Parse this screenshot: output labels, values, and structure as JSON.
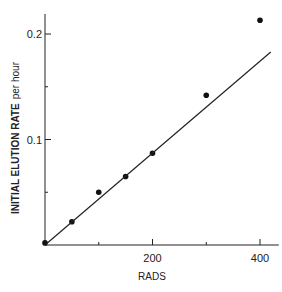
{
  "chart_data": {
    "type": "scatter",
    "title": "",
    "xlabel": "RADS",
    "ylabel": "INITIAL ELUTION RATE",
    "ylabel_unit": "per hour",
    "xlim": [
      0,
      420
    ],
    "ylim": [
      0,
      0.22
    ],
    "x_ticks": [
      0,
      100,
      200,
      300,
      400
    ],
    "x_tick_labels": [
      "",
      "",
      "200",
      "",
      "400"
    ],
    "y_ticks": [
      0,
      0.05,
      0.1,
      0.15,
      0.2
    ],
    "y_tick_labels": [
      "",
      "",
      "0.1",
      "",
      "0.2"
    ],
    "grid": false,
    "legend": null,
    "series": [
      {
        "name": "measured",
        "style": "points",
        "x": [
          0,
          50,
          100,
          150,
          200,
          300,
          400
        ],
        "y": [
          0.002,
          0.022,
          0.05,
          0.065,
          0.087,
          0.142,
          0.213
        ]
      },
      {
        "name": "fit line",
        "style": "line",
        "x": [
          0,
          420
        ],
        "y": [
          0,
          0.183
        ]
      }
    ]
  }
}
